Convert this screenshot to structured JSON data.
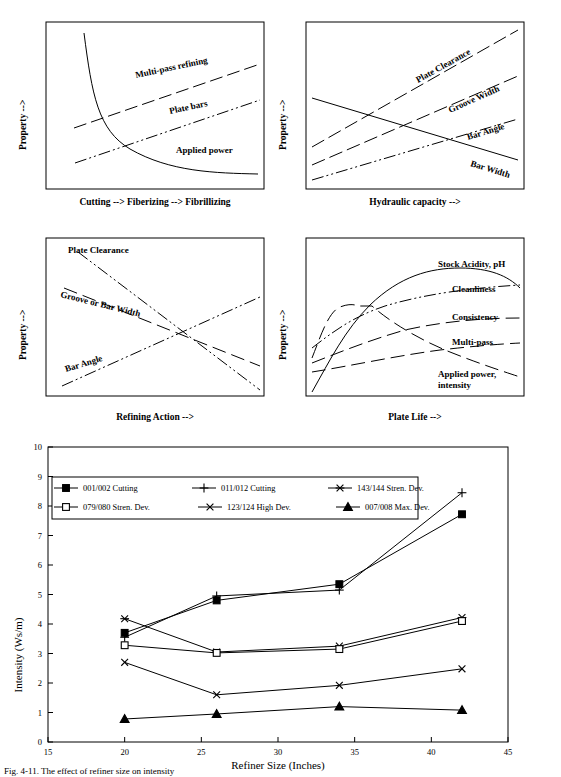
{
  "figure": {
    "caption_partial": "Fig. 4-11.  The effect of refiner size on intensity"
  },
  "panels": [
    {
      "id": "top-left",
      "ylabel": "Property   -->",
      "xlabel": "Cutting    -->    Fiberizing    -->    Fibrillizing",
      "curves": [
        {
          "name": "Multi-pass refining",
          "label": "Multi-pass refining",
          "style": "dashed",
          "shape": "rising-line"
        },
        {
          "name": "Plate bars",
          "label": "Plate bars",
          "style": "dash-dot-dot",
          "shape": "rising-line"
        },
        {
          "name": "Applied power",
          "label": "Applied power",
          "style": "solid",
          "shape": "decaying-curve"
        }
      ]
    },
    {
      "id": "top-right",
      "ylabel": "Property   -->",
      "xlabel": "Hydraulic capacity   -->",
      "curves": [
        {
          "name": "Plate Clearance",
          "label": "Plate Clearance",
          "style": "dashed",
          "shape": "rising-steep"
        },
        {
          "name": "Groove Width",
          "label": "Groove Width",
          "style": "dashed",
          "shape": "rising-medium"
        },
        {
          "name": "Bar Angle",
          "label": "Bar Angle",
          "style": "dash-dot-dot",
          "shape": "rising-shallow"
        },
        {
          "name": "Bar Width",
          "label": "Bar Width",
          "style": "solid",
          "shape": "falling-line"
        }
      ]
    },
    {
      "id": "bottom-left",
      "ylabel": "Property   -->",
      "xlabel": "Refining Action   -->",
      "curves": [
        {
          "name": "Plate Clearance",
          "label": "Plate Clearance",
          "style": "dash-dot-dot",
          "shape": "falling-steep"
        },
        {
          "name": "Groove or Bar Width",
          "label": "Groove or Bar Width",
          "style": "dashed",
          "shape": "falling-shallow"
        },
        {
          "name": "Bar Angle",
          "label": "Bar Angle",
          "style": "dash-dot-dot",
          "shape": "rising-line"
        }
      ]
    },
    {
      "id": "bottom-right",
      "ylabel": "Property   -->",
      "xlabel": "Plate Life   -->",
      "curves": [
        {
          "name": "Stock Acidity, pH",
          "label": "Stock Acidity, pH",
          "style": "solid",
          "shape": "s-curve-peak"
        },
        {
          "name": "Cleanliness",
          "label": "Cleanliness",
          "style": "dash-dot-dot",
          "shape": "rising-saturating"
        },
        {
          "name": "Consistency",
          "label": "Consistency",
          "style": "dashed",
          "shape": "rising-saturating"
        },
        {
          "name": "Multi-pass",
          "label": "Multi-pass",
          "style": "dashed",
          "shape": "rising-shallow"
        },
        {
          "name": "Applied power, intensity",
          "label": "Applied power,",
          "label2": "intensity",
          "style": "dashed",
          "shape": "hump-then-fall"
        }
      ]
    }
  ],
  "chart_data": {
    "type": "line",
    "title": "",
    "xlabel": "Refiner Size (Inches)",
    "ylabel": "Intensity  (Ws/m)",
    "xlim": [
      15,
      45
    ],
    "ylim": [
      0,
      10
    ],
    "xticks": [
      15,
      20,
      25,
      30,
      35,
      40,
      45
    ],
    "yticks": [
      0,
      1,
      2,
      3,
      4,
      5,
      6,
      7,
      8,
      9,
      10
    ],
    "grid": false,
    "legend_position": "top-left-inside",
    "x": [
      20,
      26,
      34,
      42
    ],
    "series": [
      {
        "name": "001/002  Cutting",
        "marker": "filled-square",
        "values": [
          3.7,
          4.8,
          5.35,
          7.72
        ]
      },
      {
        "name": "011/012  Cutting",
        "marker": "plus",
        "values": [
          3.55,
          4.95,
          5.15,
          8.45
        ]
      },
      {
        "name": "143/144 Stren. Dev.",
        "marker": "asterisk",
        "values": [
          4.18,
          3.05,
          3.25,
          4.22
        ]
      },
      {
        "name": "079/080 Stren. Dev.",
        "marker": "open-square",
        "values": [
          3.28,
          3.02,
          3.15,
          4.1
        ]
      },
      {
        "name": "123/124  High Dev.",
        "marker": "x-cross",
        "values": [
          2.7,
          1.6,
          1.92,
          2.48
        ]
      },
      {
        "name": "007/008  Max. Dev.",
        "marker": "filled-triangle",
        "values": [
          0.78,
          0.95,
          1.2,
          1.08
        ]
      }
    ]
  }
}
